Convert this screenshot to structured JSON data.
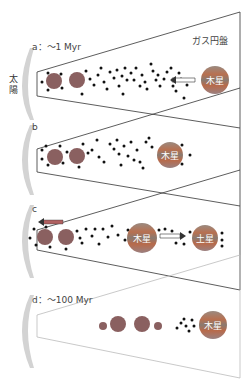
{
  "labels": {
    "sun": "太陽",
    "gas_disk": "ガス円盤",
    "panel_a": "a：～1 Myr",
    "panel_b": "b",
    "panel_c": "c",
    "panel_d": "d：～100 Myr",
    "jupiter": "木星",
    "saturn": "土星"
  },
  "colors": {
    "sun": "#d0d0d0",
    "planet": "#8a8a8a",
    "planetesimal": "#111111",
    "panel_line": "#333333",
    "panel_line_faded": "#bbbbbb",
    "jupiter_band": "#b86a4a",
    "arrow": "#b06060"
  },
  "panels": [
    {
      "id": "a",
      "jupiter_x": 215,
      "center_y": 78,
      "arrow": "inward"
    },
    {
      "id": "b",
      "jupiter_x": 170,
      "center_y": 155,
      "arrow": "none"
    },
    {
      "id": "c",
      "jupiter_x": 170,
      "center_y": 237,
      "arrow": "outward",
      "saturn_x": 220
    },
    {
      "id": "d",
      "jupiter_x": 215,
      "center_y": 324,
      "arrow": "none"
    }
  ]
}
